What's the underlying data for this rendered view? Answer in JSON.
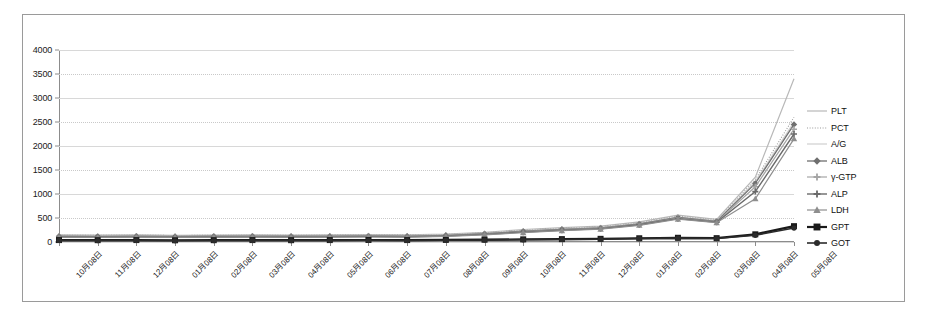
{
  "chart_data": {
    "type": "line",
    "title": "",
    "xlabel": "",
    "ylabel": "",
    "ylim": [
      0,
      4000
    ],
    "ytick_step": 500,
    "grid": true,
    "legend_position": "right",
    "ytick_labels": [
      "4000",
      "3500",
      "3000",
      "2500",
      "2000",
      "1500",
      "1000",
      "500",
      "0"
    ],
    "categories": [
      "10月08日",
      "11月08日",
      "12月08日",
      "01月08日",
      "02月08日",
      "03月08日",
      "04月08日",
      "05月08日",
      "06月08日",
      "07月08日",
      "08月08日",
      "09月08日",
      "10月08日",
      "11月08日",
      "12月08日",
      "01月08日",
      "02月08日",
      "03月08日",
      "04月08日",
      "05月08日"
    ],
    "series": [
      {
        "name": "PLT",
        "color": "#b8b8b8",
        "marker": "none",
        "dash": "none",
        "width": 1.2,
        "values": [
          150,
          145,
          150,
          140,
          145,
          150,
          145,
          150,
          155,
          150,
          165,
          200,
          260,
          300,
          330,
          420,
          560,
          470,
          1350,
          3400
        ]
      },
      {
        "name": "PCT",
        "color": "#9a9a9a",
        "marker": "none",
        "dash": "1,1.6",
        "width": 1.1,
        "values": [
          140,
          138,
          142,
          135,
          140,
          142,
          140,
          142,
          145,
          142,
          155,
          190,
          245,
          285,
          315,
          400,
          540,
          450,
          1300,
          2600
        ]
      },
      {
        "name": "A/G",
        "color": "#cfcfcf",
        "marker": "none",
        "dash": "none",
        "width": 1.2,
        "values": [
          130,
          128,
          132,
          126,
          130,
          132,
          130,
          132,
          136,
          132,
          148,
          180,
          235,
          275,
          305,
          390,
          525,
          440,
          1260,
          2500
        ]
      },
      {
        "name": "ALB",
        "color": "#6f6f6f",
        "marker": "diamond",
        "dash": "none",
        "width": 1.3,
        "values": [
          120,
          118,
          122,
          116,
          120,
          122,
          120,
          122,
          126,
          122,
          140,
          172,
          225,
          265,
          295,
          378,
          510,
          430,
          1220,
          2450
        ]
      },
      {
        "name": "γ-GTP",
        "color": "#a5a5a5",
        "marker": "cross",
        "dash": "none",
        "width": 1.2,
        "values": [
          112,
          110,
          114,
          108,
          112,
          114,
          112,
          114,
          118,
          114,
          132,
          165,
          215,
          255,
          288,
          368,
          498,
          420,
          1150,
          2350
        ]
      },
      {
        "name": "ALP",
        "color": "#6a6a6a",
        "marker": "plus",
        "dash": "none",
        "width": 1.4,
        "values": [
          105,
          103,
          107,
          101,
          105,
          107,
          105,
          107,
          111,
          107,
          125,
          158,
          205,
          245,
          278,
          358,
          486,
          412,
          1050,
          2250
        ]
      },
      {
        "name": "LDH",
        "color": "#8e8e8e",
        "marker": "triangle",
        "dash": "none",
        "width": 1.2,
        "values": [
          98,
          96,
          100,
          94,
          98,
          100,
          98,
          100,
          104,
          100,
          118,
          150,
          195,
          235,
          268,
          348,
          475,
          402,
          900,
          2150
        ]
      },
      {
        "name": "GPT",
        "color": "#1a1a1a",
        "marker": "square",
        "dash": "none",
        "width": 2.2,
        "values": [
          40,
          38,
          40,
          36,
          38,
          40,
          38,
          40,
          42,
          40,
          44,
          48,
          55,
          60,
          66,
          78,
          88,
          80,
          160,
          330
        ]
      },
      {
        "name": "GOT",
        "color": "#2b2b2b",
        "marker": "circle",
        "dash": "none",
        "width": 1.6,
        "values": [
          32,
          30,
          32,
          28,
          30,
          32,
          30,
          32,
          34,
          32,
          36,
          40,
          46,
          52,
          58,
          70,
          80,
          72,
          140,
          290
        ]
      }
    ]
  }
}
